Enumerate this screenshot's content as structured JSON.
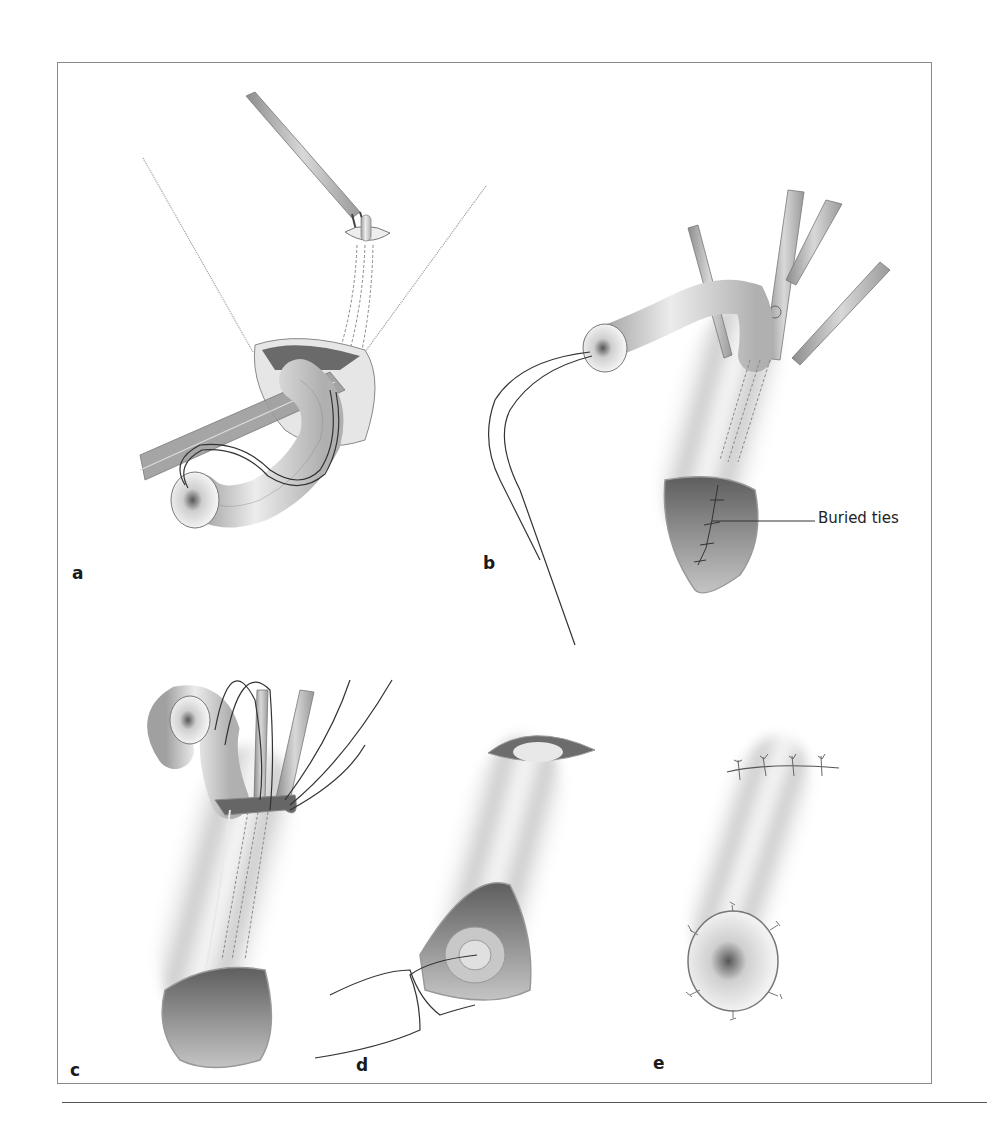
{
  "figure": {
    "panels": [
      {
        "id": "a",
        "label": "a"
      },
      {
        "id": "b",
        "label": "b",
        "callouts": [
          {
            "text": "Buried ties"
          }
        ]
      },
      {
        "id": "c",
        "label": "c"
      },
      {
        "id": "d",
        "label": "d"
      },
      {
        "id": "e",
        "label": "e"
      }
    ]
  },
  "colors": {
    "frame": "#8a8a8a",
    "tissue_light": "#eeeeee",
    "tissue_mid": "#bdbdbd",
    "tissue_dark": "#6d6d6d",
    "suture": "#333333",
    "instrument": "#a8a8a8"
  }
}
